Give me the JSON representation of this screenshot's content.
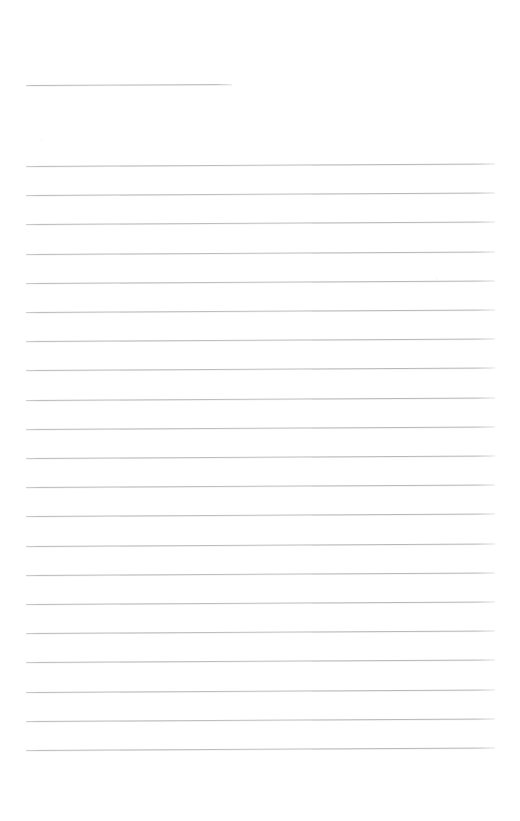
{
  "document": {
    "kind": "ruled-notepaper",
    "page_width": 520,
    "page_height": 821,
    "background_color": "#ffffff",
    "rule_color": "#bebec4",
    "rule_thickness_px": 1,
    "rule_skew_deg": -0.3,
    "content_text": "",
    "header_rule": {
      "label": "",
      "x": 26,
      "y": 85,
      "width": 206
    },
    "body_rules": {
      "count": 21,
      "x": 26,
      "width": 469,
      "first_y": 166,
      "spacing": 29.2,
      "lines": [
        {
          "index": 1,
          "y": 166,
          "text": ""
        },
        {
          "index": 2,
          "y": 195,
          "text": ""
        },
        {
          "index": 3,
          "y": 224,
          "text": ""
        },
        {
          "index": 4,
          "y": 254,
          "text": ""
        },
        {
          "index": 5,
          "y": 283,
          "text": ""
        },
        {
          "index": 6,
          "y": 312,
          "text": ""
        },
        {
          "index": 7,
          "y": 341,
          "text": ""
        },
        {
          "index": 8,
          "y": 370,
          "text": ""
        },
        {
          "index": 9,
          "y": 400,
          "text": ""
        },
        {
          "index": 10,
          "y": 429,
          "text": ""
        },
        {
          "index": 11,
          "y": 458,
          "text": ""
        },
        {
          "index": 12,
          "y": 487,
          "text": ""
        },
        {
          "index": 13,
          "y": 516,
          "text": ""
        },
        {
          "index": 14,
          "y": 546,
          "text": ""
        },
        {
          "index": 15,
          "y": 575,
          "text": ""
        },
        {
          "index": 16,
          "y": 604,
          "text": ""
        },
        {
          "index": 17,
          "y": 633,
          "text": ""
        },
        {
          "index": 18,
          "y": 662,
          "text": ""
        },
        {
          "index": 19,
          "y": 692,
          "text": ""
        },
        {
          "index": 20,
          "y": 721,
          "text": ""
        },
        {
          "index": 21,
          "y": 750,
          "text": ""
        }
      ]
    }
  }
}
